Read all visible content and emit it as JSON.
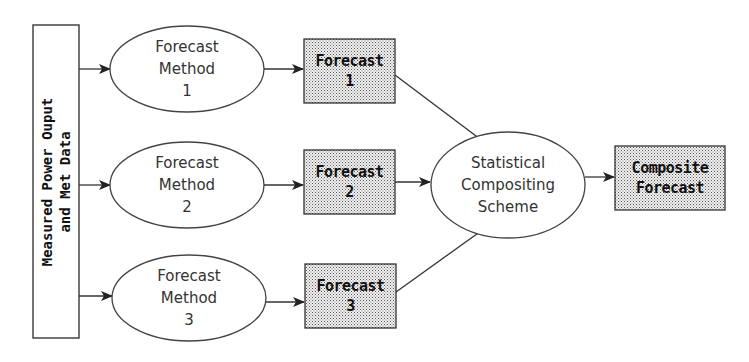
{
  "diagram": {
    "input": {
      "line1": "Measured Power Ouput",
      "line2": "and Met Data"
    },
    "methods": [
      {
        "line1": "Forecast",
        "line2": "Method",
        "line3": "1"
      },
      {
        "line1": "Forecast",
        "line2": "Method",
        "line3": "2"
      },
      {
        "line1": "Forecast",
        "line2": "Method",
        "line3": "3"
      }
    ],
    "forecasts": [
      {
        "line1": "Forecast",
        "line2": "1"
      },
      {
        "line1": "Forecast",
        "line2": "2"
      },
      {
        "line1": "Forecast",
        "line2": "3"
      }
    ],
    "compositor": {
      "line1": "Statistical",
      "line2": "Compositing",
      "line3": "Scheme"
    },
    "output": {
      "line1": "Composite",
      "line2": "Forecast"
    },
    "colors": {
      "stroke": "#333333",
      "fill_box": "#d8d8d8",
      "background": "#ffffff"
    }
  }
}
